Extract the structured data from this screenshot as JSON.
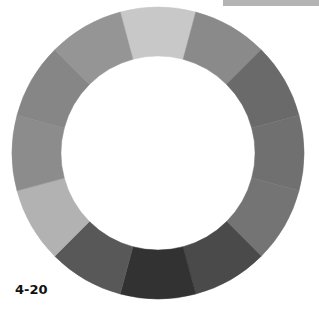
{
  "figure": {
    "label": "4-20",
    "top_bar_color": "#b4b4b4"
  },
  "wheel": {
    "center": [
      158,
      153
    ],
    "outer_radius": 146,
    "inner_radius": 97,
    "segments": [
      {
        "angle": 0,
        "color": "#c8c8c8"
      },
      {
        "angle": 30,
        "color": "#8a8a8a"
      },
      {
        "angle": 60,
        "color": "#6a6a6a"
      },
      {
        "angle": 90,
        "color": "#707070"
      },
      {
        "angle": 120,
        "color": "#747474"
      },
      {
        "angle": 150,
        "color": "#4a4a4a"
      },
      {
        "angle": 180,
        "color": "#323232"
      },
      {
        "angle": 210,
        "color": "#585858"
      },
      {
        "angle": 240,
        "color": "#b2b2b2"
      },
      {
        "angle": 270,
        "color": "#8c8c8c"
      },
      {
        "angle": 300,
        "color": "#868686"
      },
      {
        "angle": 330,
        "color": "#959595"
      }
    ]
  }
}
